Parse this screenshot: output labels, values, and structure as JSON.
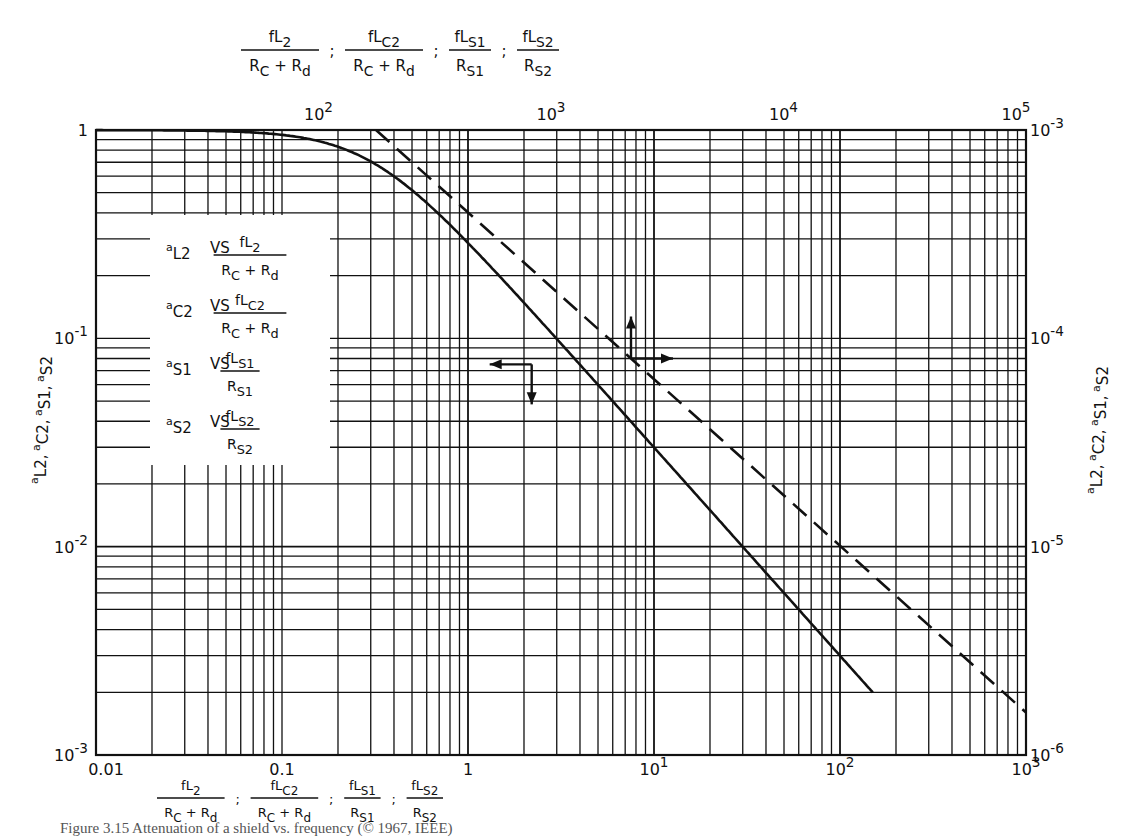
{
  "chart_data": {
    "type": "line",
    "title": "",
    "scale": "log-log",
    "grid": true,
    "axes": {
      "bottom": {
        "label_terms": [
          {
            "num": "fL",
            "num_sub": "2",
            "den": "R",
            "den_sub": "C",
            "den2": "R",
            "den2_sub": "d"
          },
          {
            "num": "fL",
            "num_sub": "C2",
            "den": "R",
            "den_sub": "C",
            "den2": "R",
            "den2_sub": "d"
          },
          {
            "num": "fL",
            "num_sub": "S1",
            "den": "R",
            "den_sub": "S1"
          },
          {
            "num": "fL",
            "num_sub": "S2",
            "den": "R",
            "den_sub": "S2"
          }
        ],
        "range": [
          0.01,
          1000
        ],
        "ticks": [
          {
            "value": 0.01,
            "label": "0.01"
          },
          {
            "value": 0.1,
            "label": "0.1"
          },
          {
            "value": 1,
            "label": "1"
          },
          {
            "value": 10,
            "label": "10",
            "exp": "1"
          },
          {
            "value": 100,
            "label": "10",
            "exp": "2"
          },
          {
            "value": 1000,
            "label": "10",
            "exp": "3"
          }
        ]
      },
      "top": {
        "label_terms": [
          {
            "num": "fL",
            "num_sub": "2",
            "den": "R",
            "den_sub": "C",
            "den2": "R",
            "den2_sub": "d"
          },
          {
            "num": "fL",
            "num_sub": "C2",
            "den": "R",
            "den_sub": "C",
            "den2": "R",
            "den2_sub": "d"
          },
          {
            "num": "fL",
            "num_sub": "S1",
            "den": "R",
            "den_sub": "S1"
          },
          {
            "num": "fL",
            "num_sub": "S2",
            "den": "R",
            "den_sub": "S2"
          }
        ],
        "range": [
          10,
          100000
        ],
        "ticks": [
          {
            "value": 100,
            "label": "10",
            "exp": "2"
          },
          {
            "value": 1000,
            "label": "10",
            "exp": "3"
          },
          {
            "value": 10000,
            "label": "10",
            "exp": "4"
          },
          {
            "value": 100000,
            "label": "10",
            "exp": "5"
          }
        ]
      },
      "left": {
        "label": "αL2, αC2, αS1, αS2",
        "label_parts": [
          {
            "pre": "a",
            "sub": "L2"
          },
          {
            "pre": "a",
            "sub": "C2"
          },
          {
            "pre": "a",
            "sub": "S1"
          },
          {
            "pre": "a",
            "sub": "S2"
          }
        ],
        "range": [
          0.001,
          1
        ],
        "ticks": [
          {
            "value": 1,
            "label": "1"
          },
          {
            "value": 0.1,
            "label": "10",
            "exp": "-1"
          },
          {
            "value": 0.01,
            "label": "10",
            "exp": "-2"
          },
          {
            "value": 0.001,
            "label": "10",
            "exp": "-3"
          }
        ]
      },
      "right": {
        "label": "αL2, αC2, αS1, αS2",
        "range": [
          1e-06,
          0.001
        ],
        "ticks": [
          {
            "value": 0.001,
            "label": "10",
            "exp": "-3"
          },
          {
            "value": 0.0001,
            "label": "10",
            "exp": "-4"
          },
          {
            "value": 1e-05,
            "label": "10",
            "exp": "-5"
          },
          {
            "value": 1e-06,
            "label": "10",
            "exp": "-6"
          }
        ]
      }
    },
    "series": [
      {
        "name": "solid (bottom/left axes)",
        "style": "solid",
        "axes": [
          "bottom",
          "left"
        ],
        "x": [
          0.01,
          0.03,
          0.05,
          0.1,
          0.2,
          0.3,
          0.5,
          0.8,
          1,
          2,
          3,
          5,
          10,
          20,
          30,
          50,
          100,
          150
        ],
        "y": [
          1.0,
          0.995,
          0.985,
          0.95,
          0.83,
          0.71,
          0.52,
          0.35,
          0.29,
          0.148,
          0.1,
          0.06,
          0.03,
          0.015,
          0.01,
          0.006,
          0.003,
          0.002
        ],
        "arrows": {
          "point": [
            2.2,
            0.075
          ],
          "directions": [
            "left",
            "down"
          ]
        }
      },
      {
        "name": "dashed (top/right axes)",
        "style": "dashed",
        "axes": [
          "top",
          "right"
        ],
        "x": [
          160,
          1000,
          10000,
          100000
        ],
        "y": [
          0.001,
          0.00016,
          1.6e-05,
          1.6e-06
        ],
        "arrows": {
          "point": [
            2000,
            8e-05
          ],
          "directions": [
            "up",
            "right"
          ]
        }
      }
    ],
    "legend": {
      "position": "inside-left",
      "entries": [
        {
          "alpha_sub": "L2",
          "vs": "VS",
          "num": "fL",
          "num_sub": "2",
          "den": "R",
          "den_sub": "C",
          "den2": "R",
          "den2_sub": "d"
        },
        {
          "alpha_sub": "C2",
          "vs": "VS",
          "num": "fL",
          "num_sub": "C2",
          "den": "R",
          "den_sub": "C",
          "den2": "R",
          "den2_sub": "d"
        },
        {
          "alpha_sub": "S1",
          "vs": "VS",
          "num": "fL",
          "num_sub": "S1",
          "den": "R",
          "den_sub": "S1"
        },
        {
          "alpha_sub": "S2",
          "vs": "VS",
          "num": "fL",
          "num_sub": "S2",
          "den": "R",
          "den_sub": "S2"
        }
      ]
    }
  },
  "caption": "Figure 3.15 Attenuation of a shield vs. frequency (© 1967, IEEE)",
  "colors": {
    "ink": "#111111",
    "grid": "#1a1a1a",
    "background": "#ffffff"
  }
}
